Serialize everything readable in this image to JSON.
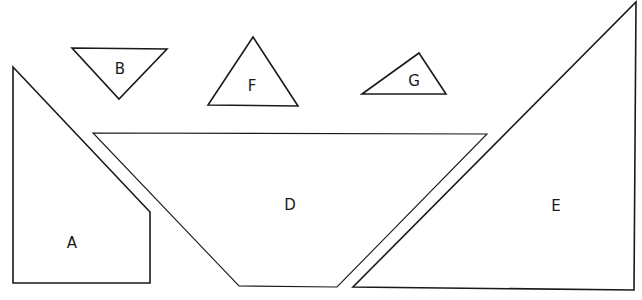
{
  "diagram": {
    "title": "",
    "pieces": [
      {
        "id": "A",
        "label": "A",
        "kind": "pentagon",
        "points": "13,67 150,212 150,283 13,283",
        "label_pos": [
          72,
          243
        ]
      },
      {
        "id": "B",
        "label": "B",
        "kind": "triangle",
        "points": "72,48 167,49 119,99",
        "label_pos": [
          120,
          69
        ]
      },
      {
        "id": "F",
        "label": "F",
        "kind": "triangle",
        "points": "253,37 298,106 208,105",
        "label_pos": [
          252,
          86
        ]
      },
      {
        "id": "G",
        "label": "G",
        "kind": "triangle",
        "points": "419,53 446,94 362,94",
        "label_pos": [
          414,
          81
        ]
      },
      {
        "id": "D",
        "label": "D",
        "kind": "trapezoid",
        "points": "93,133 487,134 337,287 239,286",
        "label_pos": [
          290,
          205
        ]
      },
      {
        "id": "E",
        "label": "E",
        "kind": "right-triangle",
        "points": "636,2 634,290 353,287",
        "label_pos": [
          556,
          206
        ]
      }
    ]
  }
}
